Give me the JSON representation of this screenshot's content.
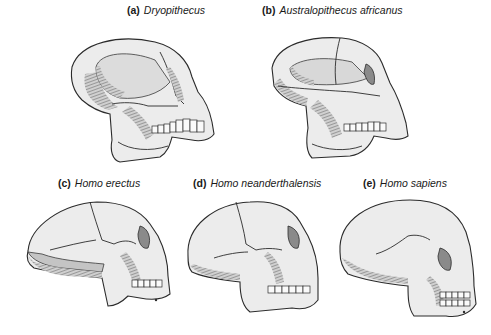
{
  "figure": {
    "panels": [
      {
        "id": "a",
        "letter": "(a)",
        "species": "Dryopithecus"
      },
      {
        "id": "b",
        "letter": "(b)",
        "species": "Australopithecus africanus"
      },
      {
        "id": "c",
        "letter": "(c)",
        "species": "Homo erectus"
      },
      {
        "id": "d",
        "letter": "(d)",
        "species": "Homo neanderthalensis"
      },
      {
        "id": "e",
        "letter": "(e)",
        "species": "Homo sapiens"
      }
    ],
    "colors": {
      "background": "#ffffff",
      "bone": "#ececec",
      "shade": "#b8b8b8",
      "ink": "#2b2b2b"
    }
  }
}
